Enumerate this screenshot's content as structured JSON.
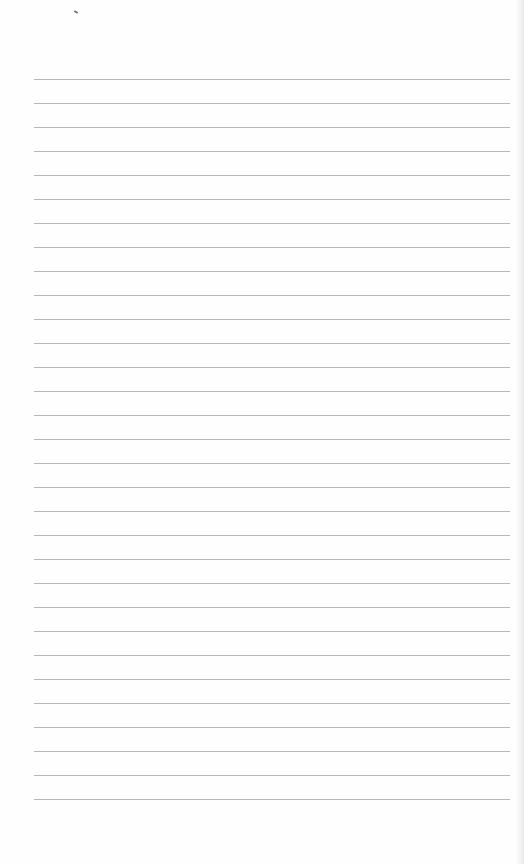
{
  "page": {
    "type": "blank lined paper",
    "line_count": 31,
    "first_line_y": 79,
    "line_spacing": 24,
    "line_color": "#b8b8b8",
    "background": "#fefefe"
  }
}
